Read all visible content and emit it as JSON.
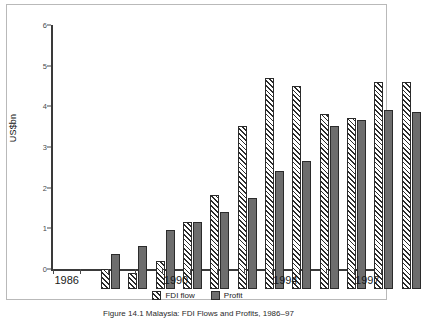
{
  "figure": {
    "caption": "Figure 14.1  Malaysia: FDI Flows and Profits, 1986–97"
  },
  "axes": {
    "y_title": "US$bn",
    "y_ticks": [
      "0",
      "1",
      "2",
      "3",
      "4",
      "5",
      "6"
    ],
    "x_labels_shown": [
      "1986",
      "1990",
      "1994",
      "1997"
    ]
  },
  "legend": {
    "items": [
      {
        "label": "FDI flow",
        "swatch": "hatched-diagonal",
        "color": "#ffffff"
      },
      {
        "label": "Profit",
        "swatch": "solid",
        "color": "#6d6d6d"
      }
    ]
  },
  "chart_data": {
    "type": "bar",
    "title": "",
    "xlabel": "",
    "ylabel": "US$bn",
    "ylim": [
      0,
      6
    ],
    "yticks": [
      0,
      1,
      2,
      3,
      4,
      5,
      6
    ],
    "grid": false,
    "legend_position": "bottom-center",
    "categories": [
      "1986",
      "1987",
      "1988",
      "1989",
      "1990",
      "1991",
      "1992",
      "1993",
      "1994",
      "1995",
      "1996",
      "1997"
    ],
    "tick_label_years": [
      "1986",
      "1990",
      "1994",
      "1997"
    ],
    "series": [
      {
        "name": "FDI flow",
        "values": [
          0.5,
          0.4,
          0.7,
          1.65,
          2.3,
          4.0,
          5.2,
          5.0,
          4.3,
          4.2,
          5.1,
          5.1
        ]
      },
      {
        "name": "Profit",
        "values": [
          0.85,
          1.05,
          1.45,
          1.65,
          1.9,
          2.25,
          2.9,
          3.15,
          4.0,
          4.15,
          4.4,
          4.35
        ]
      }
    ]
  },
  "colors": {
    "axis": "#3a3a3a",
    "frame": "#b9b9b9",
    "profit_fill": "#6d6d6d",
    "hatch_stroke": "#2b2b2b",
    "background": "#ffffff"
  }
}
